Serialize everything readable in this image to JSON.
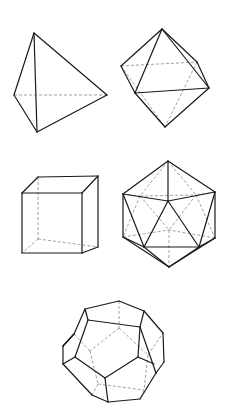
{
  "figure": {
    "solids": [
      {
        "name": "tetrahedron",
        "solid_edges": [
          [
            [
              34,
              33
            ],
            [
              14,
              95
            ]
          ],
          [
            [
              34,
              33
            ],
            [
              107,
              95
            ]
          ],
          [
            [
              34,
              33
            ],
            [
              37,
              132
            ]
          ],
          [
            [
              14,
              95
            ],
            [
              37,
              132
            ]
          ],
          [
            [
              107,
              95
            ],
            [
              37,
              132
            ]
          ]
        ],
        "hidden_edges": [
          [
            [
              14,
              95
            ],
            [
              107,
              95
            ]
          ]
        ]
      },
      {
        "name": "octahedron",
        "solid_edges": [
          [
            [
              162,
              29
            ],
            [
              121,
              66
            ]
          ],
          [
            [
              162,
              29
            ],
            [
              197,
              62
            ]
          ],
          [
            [
              162,
              29
            ],
            [
              135,
              93
            ]
          ],
          [
            [
              162,
              29
            ],
            [
              209,
              88
            ]
          ],
          [
            [
              197,
              62
            ],
            [
              209,
              88
            ]
          ],
          [
            [
              121,
              66
            ],
            [
              135,
              93
            ]
          ],
          [
            [
              135,
              93
            ],
            [
              209,
              88
            ]
          ],
          [
            [
              135,
              93
            ],
            [
              165,
              127
            ]
          ],
          [
            [
              209,
              88
            ],
            [
              165,
              127
            ]
          ]
        ],
        "hidden_edges": [
          [
            [
              121,
              66
            ],
            [
              197,
              62
            ]
          ],
          [
            [
              121,
              66
            ],
            [
              165,
              127
            ]
          ],
          [
            [
              197,
              62
            ],
            [
              165,
              127
            ]
          ]
        ]
      },
      {
        "name": "cube",
        "solid_edges": [
          [
            [
              22,
              193
            ],
            [
              82,
              193
            ]
          ],
          [
            [
              82,
              193
            ],
            [
              82,
              253
            ]
          ],
          [
            [
              82,
              253
            ],
            [
              22,
              253
            ]
          ],
          [
            [
              22,
              253
            ],
            [
              22,
              193
            ]
          ],
          [
            [
              22,
              193
            ],
            [
              38,
              177
            ]
          ],
          [
            [
              38,
              177
            ],
            [
              98,
              176
            ]
          ],
          [
            [
              98,
              176
            ],
            [
              82,
              193
            ]
          ],
          [
            [
              98,
              176
            ],
            [
              98,
              247
            ]
          ],
          [
            [
              98,
              247
            ],
            [
              82,
              253
            ]
          ]
        ],
        "hidden_edges": [
          [
            [
              38,
              177
            ],
            [
              38,
              239
            ]
          ],
          [
            [
              38,
              239
            ],
            [
              98,
              247
            ]
          ],
          [
            [
              38,
              239
            ],
            [
              22,
              253
            ]
          ]
        ]
      },
      {
        "name": "icosahedron",
        "solid_edges": [
          [
            [
              168,
              161
            ],
            [
              123,
              194
            ]
          ],
          [
            [
              168,
              161
            ],
            [
              215,
              192
            ]
          ],
          [
            [
              168,
              161
            ],
            [
              168,
              201
            ]
          ],
          [
            [
              123,
              194
            ],
            [
              168,
              201
            ]
          ],
          [
            [
              215,
              192
            ],
            [
              168,
              201
            ]
          ],
          [
            [
              123,
              194
            ],
            [
              123,
              237
            ]
          ],
          [
            [
              215,
              192
            ],
            [
              215,
              238
            ]
          ],
          [
            [
              123,
              194
            ],
            [
              144,
              247
            ]
          ],
          [
            [
              215,
              192
            ],
            [
              199,
              247
            ]
          ],
          [
            [
              168,
              201
            ],
            [
              144,
              247
            ]
          ],
          [
            [
              168,
              201
            ],
            [
              199,
              247
            ]
          ],
          [
            [
              144,
              247
            ],
            [
              199,
              247
            ]
          ],
          [
            [
              123,
              237
            ],
            [
              144,
              247
            ]
          ],
          [
            [
              215,
              238
            ],
            [
              199,
              247
            ]
          ],
          [
            [
              123,
              237
            ],
            [
              169,
              267
            ]
          ],
          [
            [
              144,
              247
            ],
            [
              169,
              267
            ]
          ],
          [
            [
              199,
              247
            ],
            [
              169,
              267
            ]
          ],
          [
            [
              215,
              238
            ],
            [
              169,
              267
            ]
          ]
        ],
        "hidden_edges": [
          [
            [
              168,
              161
            ],
            [
              140,
              196
            ]
          ],
          [
            [
              168,
              161
            ],
            [
              196,
              195
            ]
          ],
          [
            [
              140,
              196
            ],
            [
              196,
              195
            ]
          ],
          [
            [
              123,
              194
            ],
            [
              140,
              196
            ]
          ],
          [
            [
              215,
              192
            ],
            [
              196,
              195
            ]
          ],
          [
            [
              140,
              196
            ],
            [
              169,
              230
            ]
          ],
          [
            [
              196,
              195
            ],
            [
              169,
              230
            ]
          ],
          [
            [
              140,
              196
            ],
            [
              123,
              237
            ]
          ],
          [
            [
              196,
              195
            ],
            [
              215,
              238
            ]
          ],
          [
            [
              123,
              237
            ],
            [
              169,
              230
            ]
          ],
          [
            [
              215,
              238
            ],
            [
              169,
              230
            ]
          ],
          [
            [
              169,
              230
            ],
            [
              169,
              267
            ]
          ]
        ]
      },
      {
        "name": "dodecahedron",
        "solid_edges": [
          [
            [
              85,
              309
            ],
            [
              119,
              301
            ]
          ],
          [
            [
              119,
              301
            ],
            [
              144,
              311
            ]
          ],
          [
            [
              144,
              311
            ],
            [
              140,
              327
            ]
          ],
          [
            [
              140,
              327
            ],
            [
              88,
              320
            ]
          ],
          [
            [
              88,
              320
            ],
            [
              85,
              309
            ]
          ],
          [
            [
              85,
              309
            ],
            [
              74,
              334
            ]
          ],
          [
            [
              74,
              334
            ],
            [
              63,
              346
            ]
          ],
          [
            [
              63,
              346
            ],
            [
              63,
              364
            ]
          ],
          [
            [
              63,
              364
            ],
            [
              75,
              357
            ]
          ],
          [
            [
              75,
              357
            ],
            [
              88,
              320
            ]
          ],
          [
            [
              144,
              311
            ],
            [
              163,
              333
            ]
          ],
          [
            [
              163,
              333
            ],
            [
              164,
              362
            ]
          ],
          [
            [
              164,
              362
            ],
            [
              156,
              373
            ]
          ],
          [
            [
              156,
              373
            ],
            [
              140,
              327
            ]
          ],
          [
            [
              140,
              327
            ],
            [
              138,
              357
            ]
          ],
          [
            [
              75,
              357
            ],
            [
              105,
              378
            ]
          ],
          [
            [
              105,
              378
            ],
            [
              138,
              357
            ]
          ],
          [
            [
              138,
              357
            ],
            [
              154,
              364
            ]
          ],
          [
            [
              63,
              364
            ],
            [
              92,
              395
            ]
          ],
          [
            [
              92,
              395
            ],
            [
              108,
              402
            ]
          ],
          [
            [
              108,
              402
            ],
            [
              105,
              378
            ]
          ],
          [
            [
              108,
              402
            ],
            [
              140,
              399
            ]
          ],
          [
            [
              140,
              399
            ],
            [
              156,
              373
            ]
          ],
          [
            [
              74,
              334
            ],
            [
              63,
              346
            ]
          ]
        ],
        "hidden_edges": [
          [
            [
              119,
              301
            ],
            [
              119,
              328
            ]
          ],
          [
            [
              119,
              328
            ],
            [
              90,
              351
            ]
          ],
          [
            [
              119,
              328
            ],
            [
              148,
              355
            ]
          ],
          [
            [
              90,
              351
            ],
            [
              74,
              334
            ]
          ],
          [
            [
              148,
              355
            ],
            [
              163,
              333
            ]
          ],
          [
            [
              90,
              351
            ],
            [
              98,
              384
            ]
          ],
          [
            [
              148,
              355
            ],
            [
              144,
              390
            ]
          ],
          [
            [
              98,
              384
            ],
            [
              144,
              390
            ]
          ],
          [
            [
              98,
              384
            ],
            [
              92,
              395
            ]
          ],
          [
            [
              144,
              390
            ],
            [
              140,
              399
            ]
          ]
        ]
      }
    ]
  }
}
